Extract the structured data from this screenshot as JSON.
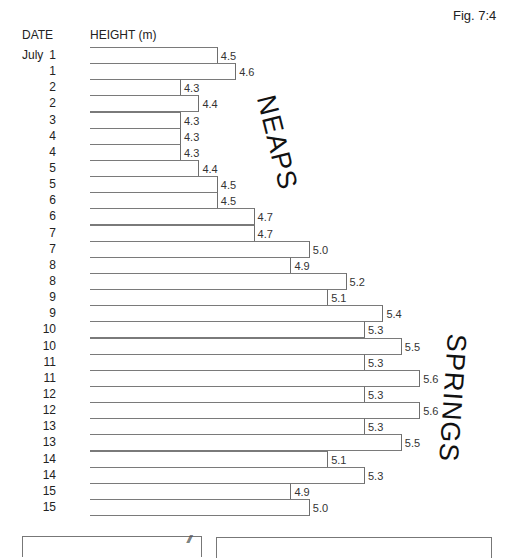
{
  "figure": {
    "label": "Fig. 7:4",
    "column_headers": {
      "date": "DATE",
      "height": "HEIGHT (m)"
    },
    "month": "July",
    "annotations": {
      "neaps": "NEAPS",
      "springs": "SPRINGS"
    },
    "hatch": "///"
  },
  "chart_data": {
    "type": "bar",
    "orientation": "horizontal",
    "title": "Fig. 7:4",
    "xlabel": "HEIGHT (m)",
    "ylabel": "DATE",
    "categories": [
      "July 1",
      "1",
      "2",
      "2",
      "3",
      "4",
      "4",
      "5",
      "5",
      "6",
      "6",
      "7",
      "7",
      "8",
      "8",
      "9",
      "9",
      "10",
      "10",
      "11",
      "11",
      "12",
      "12",
      "13",
      "13",
      "14",
      "14",
      "15",
      "15"
    ],
    "values": [
      4.5,
      4.6,
      4.3,
      4.4,
      4.3,
      4.3,
      4.3,
      4.4,
      4.5,
      4.5,
      4.7,
      4.7,
      5.0,
      4.9,
      5.2,
      5.1,
      5.4,
      5.3,
      5.5,
      5.3,
      5.6,
      5.3,
      5.6,
      5.3,
      5.5,
      5.1,
      5.3,
      4.9,
      5.0
    ],
    "annotations": [
      {
        "text": "NEAPS",
        "near_dates": "July 2–6"
      },
      {
        "text": "SPRINGS",
        "near_dates": "July 10–14"
      }
    ],
    "data_labels": true,
    "grid": false,
    "legend": null
  },
  "rows": [
    {
      "month": "July",
      "day": "1",
      "value": "4.5"
    },
    {
      "month": "",
      "day": "1",
      "value": "4.6"
    },
    {
      "month": "",
      "day": "2",
      "value": "4.3"
    },
    {
      "month": "",
      "day": "2",
      "value": "4.4"
    },
    {
      "month": "",
      "day": "3",
      "value": "4.3"
    },
    {
      "month": "",
      "day": "4",
      "value": "4.3"
    },
    {
      "month": "",
      "day": "4",
      "value": "4.3"
    },
    {
      "month": "",
      "day": "5",
      "value": "4.4"
    },
    {
      "month": "",
      "day": "5",
      "value": "4.5"
    },
    {
      "month": "",
      "day": "6",
      "value": "4.5"
    },
    {
      "month": "",
      "day": "6",
      "value": "4.7"
    },
    {
      "month": "",
      "day": "7",
      "value": "4.7"
    },
    {
      "month": "",
      "day": "7",
      "value": "5.0"
    },
    {
      "month": "",
      "day": "8",
      "value": "4.9"
    },
    {
      "month": "",
      "day": "8",
      "value": "5.2"
    },
    {
      "month": "",
      "day": "9",
      "value": "5.1"
    },
    {
      "month": "",
      "day": "9",
      "value": "5.4"
    },
    {
      "month": "",
      "day": "10",
      "value": "5.3"
    },
    {
      "month": "",
      "day": "10",
      "value": "5.5"
    },
    {
      "month": "",
      "day": "11",
      "value": "5.3"
    },
    {
      "month": "",
      "day": "11",
      "value": "5.6"
    },
    {
      "month": "",
      "day": "12",
      "value": "5.3"
    },
    {
      "month": "",
      "day": "12",
      "value": "5.6"
    },
    {
      "month": "",
      "day": "13",
      "value": "5.3"
    },
    {
      "month": "",
      "day": "13",
      "value": "5.5"
    },
    {
      "month": "",
      "day": "14",
      "value": "5.1"
    },
    {
      "month": "",
      "day": "14",
      "value": "5.3"
    },
    {
      "month": "",
      "day": "15",
      "value": "4.9"
    },
    {
      "month": "",
      "day": "15",
      "value": "5.0"
    }
  ]
}
